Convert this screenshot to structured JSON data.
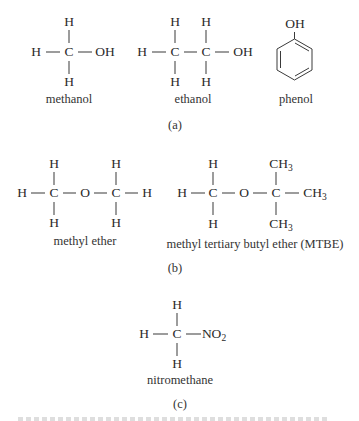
{
  "panels": {
    "a": {
      "label": "(a)",
      "methanol": {
        "name": "methanol",
        "atoms": {
          "top": "H",
          "left": "H",
          "center": "C",
          "right": "OH",
          "bottom": "H"
        }
      },
      "ethanol": {
        "name": "ethanol",
        "atoms": {
          "top1": "H",
          "top2": "H",
          "left": "H",
          "c1": "C",
          "c2": "C",
          "right": "OH",
          "bottom1": "H",
          "bottom2": "H"
        }
      },
      "phenol": {
        "name": "phenol",
        "substituent": "OH"
      }
    },
    "b": {
      "label": "(b)",
      "methyl_ether": {
        "name": "methyl ether",
        "atoms": {
          "top1": "H",
          "top2": "H",
          "left": "H",
          "c1": "C",
          "o": "O",
          "c2": "C",
          "right": "H",
          "bottom1": "H",
          "bottom2": "H"
        }
      },
      "mtbe": {
        "name": "methyl tertiary butyl ether (MTBE)",
        "atoms": {
          "top1": "H",
          "left": "H",
          "c1": "C",
          "o": "O",
          "c2": "C",
          "bottom1": "H",
          "ch3_base": "CH",
          "ch3_sub": "3"
        }
      }
    },
    "c": {
      "label": "(c)",
      "nitromethane": {
        "name": "nitromethane",
        "atoms": {
          "top": "H",
          "left": "H",
          "center": "C",
          "no2_base": "NO",
          "no2_sub": "2",
          "bottom": "H"
        }
      }
    }
  }
}
